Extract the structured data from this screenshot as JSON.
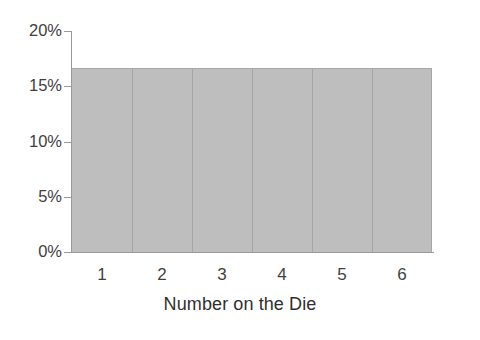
{
  "chart_data": {
    "type": "bar",
    "title": "",
    "subtitle": "",
    "xlabel": "Number on the Die",
    "ylabel": "",
    "categories": [
      "1",
      "2",
      "3",
      "4",
      "5",
      "6"
    ],
    "values": [
      16.67,
      16.67,
      16.67,
      16.67,
      16.67,
      16.67
    ],
    "value_unit": "%",
    "ylim": [
      0,
      20
    ],
    "ytick_values": [
      20,
      15,
      10,
      5,
      0
    ],
    "ytick_labels": [
      "20%",
      "15%",
      "10%",
      "5%",
      "0%"
    ],
    "xtick_labels": [
      "1",
      "2",
      "3",
      "4",
      "5",
      "6"
    ],
    "grid": false,
    "legend": null,
    "legend_position": "none",
    "annotations": [],
    "bars_contiguous": true,
    "colors": {
      "bar_fill": "#bebebe",
      "bar_edge": "#a6a6a6",
      "axis": "#9a9a9a",
      "text": "#3f3f3f",
      "background": "#ffffff"
    }
  },
  "axes": {
    "y": {
      "ticks": [
        {
          "label": "20%",
          "value": 20
        },
        {
          "label": "15%",
          "value": 15
        },
        {
          "label": "10%",
          "value": 10
        },
        {
          "label": "5%",
          "value": 5
        },
        {
          "label": "0%",
          "value": 0
        }
      ]
    },
    "x": {
      "title": "Number on the Die",
      "ticks": [
        {
          "label": "1"
        },
        {
          "label": "2"
        },
        {
          "label": "3"
        },
        {
          "label": "4"
        },
        {
          "label": "5"
        },
        {
          "label": "6"
        }
      ]
    }
  }
}
